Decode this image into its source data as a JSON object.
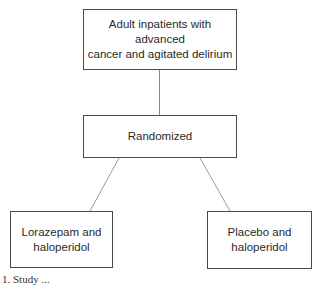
{
  "diagram": {
    "type": "flowchart",
    "nodes": [
      {
        "id": "population",
        "label": "Adult inpatients with advanced cancer and agitated delirium",
        "line1": "Adult inpatients with advanced",
        "line2": "cancer and agitated delirium"
      },
      {
        "id": "randomized",
        "label": "Randomized"
      },
      {
        "id": "arm_a",
        "label": "Lorazepam and haloperidol",
        "line1": "Lorazepam and",
        "line2": "haloperidol"
      },
      {
        "id": "arm_b",
        "label": "Placebo and haloperidol",
        "line1": "Placebo and",
        "line2": "haloperidol"
      }
    ],
    "edges": [
      {
        "from": "population",
        "to": "randomized"
      },
      {
        "from": "randomized",
        "to": "arm_a"
      },
      {
        "from": "randomized",
        "to": "arm_b"
      }
    ],
    "caption": "1. Study ..."
  },
  "colors": {
    "border": "#4a4a4a",
    "line": "#8a8a8a",
    "text": "#2a2a2a"
  }
}
